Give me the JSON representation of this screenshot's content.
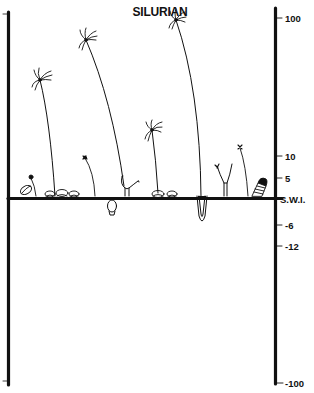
{
  "title": "SILURIAN",
  "axis": {
    "labels": [
      {
        "text": "100",
        "y": 18
      },
      {
        "text": "10",
        "y": 156
      },
      {
        "text": "5",
        "y": 178
      },
      {
        "text": "S.W.I.",
        "y": 199
      },
      {
        "text": "-6",
        "y": 225
      },
      {
        "text": "-12",
        "y": 246
      },
      {
        "text": "-100",
        "y": 382
      }
    ],
    "unit_note": "height above / depth below sediment-water interface (cm)"
  },
  "colors": {
    "ink": "#111111",
    "background": "#ffffff"
  },
  "organisms": [
    {
      "name": "crinoid-tall-1",
      "base_x": 54,
      "top_x": 40,
      "top_y": 80
    },
    {
      "name": "crinoid-tall-2",
      "base_x": 124,
      "top_x": 86,
      "top_y": 40
    },
    {
      "name": "crinoid-tallest",
      "base_x": 201,
      "top_x": 176,
      "top_y": 20
    },
    {
      "name": "crinoid-medium",
      "base_x": 158,
      "top_x": 152,
      "top_y": 130
    },
    {
      "name": "small-stalked-1",
      "base_x": 36,
      "top_x": 31,
      "top_y": 178
    },
    {
      "name": "small-stalked-2",
      "base_x": 95,
      "top_x": 84,
      "top_y": 158
    },
    {
      "name": "small-stalked-3",
      "base_x": 248,
      "top_x": 240,
      "top_y": 148
    },
    {
      "name": "branching-y-1",
      "base_x": 127,
      "top_x": 127,
      "top_y": 180
    },
    {
      "name": "branching-y-2",
      "base_x": 226,
      "top_x": 226,
      "top_y": 164
    }
  ]
}
